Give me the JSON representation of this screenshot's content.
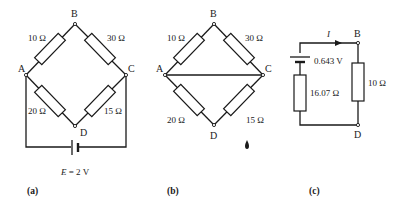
{
  "figures": {
    "a": {
      "caption": "(a)",
      "nodes": {
        "A": "A",
        "B": "B",
        "C": "C",
        "D": "D"
      },
      "resistors": {
        "AB": "10 Ω",
        "BC": "30 Ω",
        "AD": "20 Ω",
        "DC": "15 Ω"
      },
      "source": {
        "symbol": "E",
        "label": " = 2 V"
      }
    },
    "b": {
      "caption": "(b)",
      "nodes": {
        "A": "A",
        "B": "B",
        "C": "C",
        "D": "D"
      },
      "resistors": {
        "AB": "10 Ω",
        "BC": "30 Ω",
        "AD": "20 Ω",
        "DC": "15 Ω"
      }
    },
    "c": {
      "caption": "(c)",
      "nodes": {
        "B": "B",
        "D": "D"
      },
      "current": "I",
      "source_voltage": "0.643 V",
      "internal_resistance": "16.07 Ω",
      "load_resistance": "10 Ω"
    }
  }
}
